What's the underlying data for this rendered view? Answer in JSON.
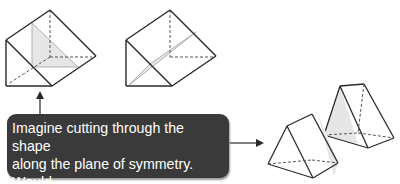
{
  "callout": {
    "lines": [
      "Imagine cutting through the shape",
      "along the plane of symmetry. Would",
      "you end up with two equal halves?"
    ]
  },
  "figures": [
    {
      "name": "prism-with-vertical-symmetry-plane",
      "plane_shading": "#e6e6e6"
    },
    {
      "name": "prism-with-diagonal-plane"
    },
    {
      "name": "two-half-prisms-result",
      "shading": "#e6e6e6"
    }
  ],
  "colors": {
    "outline": "#2a2a2a",
    "hidden_edge": "#555555",
    "plane_edge": "#b0b0b0",
    "callout_bg": "#3a3a3a",
    "callout_text": "#ffffff"
  }
}
